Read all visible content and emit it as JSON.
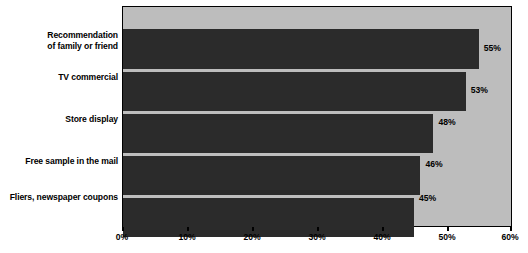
{
  "chart_data": {
    "type": "bar",
    "orientation": "horizontal",
    "title": "",
    "xlabel": "",
    "ylabel": "",
    "xlim": [
      0,
      60
    ],
    "grid": false,
    "legend": null,
    "categories": [
      "Recommendation of family or friend",
      "TV commercial",
      "Store display",
      "Free sample in the mail",
      "Fliers, newspaper coupons"
    ],
    "values": [
      55,
      53,
      48,
      46,
      45
    ],
    "value_labels": [
      "55%",
      "53%",
      "48%",
      "46%",
      "45%"
    ],
    "xticks": [
      0,
      10,
      20,
      30,
      40,
      50,
      60
    ],
    "xtick_labels": [
      "0%",
      "10%",
      "20%",
      "30%",
      "40%",
      "50%",
      "60%"
    ],
    "colors": {
      "bar": "#2b2b2b",
      "plot_background": "#bdbdbd",
      "axis": "#000000",
      "text": "#000000",
      "page_background": "#ffffff"
    }
  },
  "labels": {
    "cat0_line1": "Recommendation",
    "cat0_line2": "of family or friend",
    "cat1": "TV commercial",
    "cat2": "Store display",
    "cat3": "Free sample in the mail",
    "cat4": "Fliers, newspaper coupons"
  },
  "values": {
    "v0": "55%",
    "v1": "53%",
    "v2": "48%",
    "v3": "46%",
    "v4": "45%"
  },
  "xticks": {
    "t0": "0%",
    "t1": "10%",
    "t2": "20%",
    "t3": "30%",
    "t4": "40%",
    "t5": "50%",
    "t6": "60%"
  },
  "footer": {
    "note": ""
  }
}
